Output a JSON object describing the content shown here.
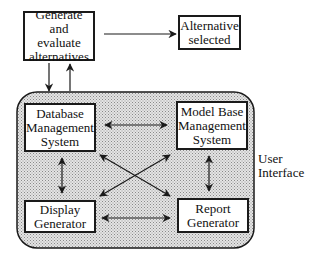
{
  "diagram": {
    "type": "flow-diagram",
    "nodes": {
      "generate": {
        "label": "Generate and\nevaluate\nalternatives"
      },
      "selected": {
        "label": "Alternative\nselected"
      },
      "dbms": {
        "label": "Database\nManagement\nSystem"
      },
      "mbms": {
        "label": "Model Base\nManagement\nSystem"
      },
      "display": {
        "label": "Display\nGenerator"
      },
      "report": {
        "label": "Report\nGenerator"
      }
    },
    "region_label": "User\nInterface",
    "edges": [
      {
        "from": "generate",
        "to": "selected",
        "direction": "one-way"
      },
      {
        "from": "generate",
        "to": "user-interface",
        "direction": "one-way"
      },
      {
        "from": "user-interface",
        "to": "generate",
        "direction": "one-way"
      },
      {
        "from": "dbms",
        "to": "mbms",
        "direction": "two-way"
      },
      {
        "from": "dbms",
        "to": "display",
        "direction": "two-way"
      },
      {
        "from": "mbms",
        "to": "report",
        "direction": "two-way"
      },
      {
        "from": "display",
        "to": "report",
        "direction": "two-way"
      },
      {
        "from": "dbms",
        "to": "report",
        "direction": "two-way"
      },
      {
        "from": "mbms",
        "to": "display",
        "direction": "two-way"
      }
    ],
    "colors": {
      "line": "#1a1a1a",
      "region_fill": "#c8c8c8",
      "box_fill": "#ffffff"
    }
  }
}
